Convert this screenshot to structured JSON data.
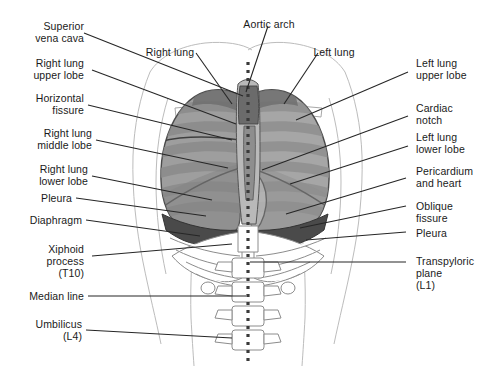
{
  "figure": {
    "palette": {
      "background": "#ffffff",
      "ink": "#1a1a1a",
      "leader": "#262626",
      "lung_fill": "#9a9a9a",
      "lung_fill_light": "#b4b4b4",
      "lung_shadow": "#6e6e6e",
      "diaphragm": "#4a4a4a",
      "bone_outline": "#8c8c8c",
      "bone_fill": "#ffffff",
      "body_outline": "#b8b8b8",
      "median_dots": "#3a3a3a"
    }
  },
  "labels": {
    "superior_vena_cava": "Superior\nvena cava",
    "right_lung_upper_lobe": "Right lung\nupper lobe",
    "horizontal_fissure": "Horizontal\nfissure",
    "right_lung_middle_lobe": "Right lung\nmiddle lobe",
    "right_lung_lower_lobe": "Right lung\nlower lobe",
    "pleura_left": "Pleura",
    "diaphragm": "Diaphragm",
    "xiphoid_process": "Xiphoid\nprocess\n(T10)",
    "median_line": "Median line",
    "umbilicus": "Umbilicus\n(L4)",
    "right_lung": "Right lung",
    "aortic_arch": "Aortic arch",
    "left_lung": "Left lung",
    "left_lung_upper_lobe": "Left lung\nupper lobe",
    "cardiac_notch": "Cardiac\nnotch",
    "left_lung_lower_lobe": "Left lung\nlower lobe",
    "pericardium_and_heart": "Pericardium\nand heart",
    "oblique_fissure": "Oblique\nfissure",
    "pleura_right": "Pleura",
    "transpyloric_plane": "Transpyloric\nplane\n(L1)"
  }
}
